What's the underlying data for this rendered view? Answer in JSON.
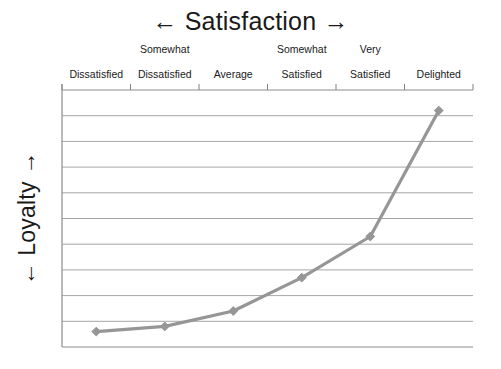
{
  "chart_data": {
    "type": "line",
    "title": "← Satisfaction →",
    "xlabel": "← Satisfaction →",
    "ylabel": "← Loyalty →",
    "categories": [
      "Dissatisfied",
      "Somewhat\nDissatisfied",
      "Average",
      "Somewhat\nSatisfied",
      "Very\nSatisfied",
      "Delighted"
    ],
    "series": [
      {
        "name": "Loyalty",
        "values": [
          6,
          8,
          14,
          27,
          43,
          92
        ]
      }
    ],
    "ylim": [
      0,
      100
    ],
    "xlim": [
      0,
      7
    ],
    "grid": true,
    "gridlines": 9,
    "legend": "none",
    "axis_tick_count": 7,
    "line_color": "#969696",
    "marker": "diamond",
    "marker_color": "#969696",
    "grid_color": "#a6a6a6",
    "axis_color": "#808080",
    "text_color": "#1a1a1a"
  },
  "labels": {
    "x_axis_title": "← Satisfaction →",
    "y_axis_title": "← Loyalty →",
    "ticks": [
      {
        "text": "Dissatisfied",
        "line1": "",
        "line2": "Dissatisfied"
      },
      {
        "text": "Somewhat Dissatisfied",
        "line1": "Somewhat",
        "line2": "Dissatisfied"
      },
      {
        "text": "Average",
        "line1": "",
        "line2": "Average"
      },
      {
        "text": "Somewhat Satisfied",
        "line1": "Somewhat",
        "line2": "Satisfied"
      },
      {
        "text": "Very Satisfied",
        "line1": "Very",
        "line2": "Satisfied"
      },
      {
        "text": "Delighted",
        "line1": "",
        "line2": "Delighted"
      }
    ]
  }
}
